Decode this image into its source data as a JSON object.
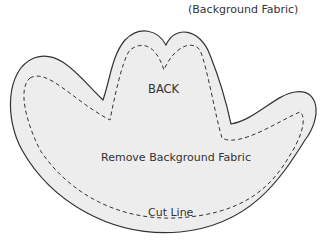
{
  "diagram": {
    "type": "sewing-pattern-piece",
    "piece": "cowboy-hat",
    "labels": {
      "background_fabric": "(Background Fabric)",
      "piece_name": "BACK",
      "instruction": "Remove Background Fabric",
      "cut_line": "Cut Line"
    },
    "colors": {
      "fill": "#ededed",
      "outline": "#333333",
      "cut_line": "#333333",
      "background": "#ffffff"
    }
  }
}
